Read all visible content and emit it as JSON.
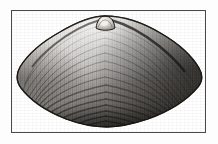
{
  "figure": {
    "kind": "scientific-illustration",
    "orientation": "exterior-left-valve",
    "technique": "halftone-engraving",
    "caption": "",
    "title": "",
    "has_text": false
  },
  "canvas": {
    "width": 218,
    "height": 144,
    "background_color": "#fdfdfd"
  },
  "frame": {
    "x": 11,
    "y": 10,
    "width": 195,
    "height": 123,
    "border_color": "#4a4a4a",
    "border_width": 1,
    "fill_color": "#ffffff"
  },
  "shell": {
    "label": "clam-shell",
    "outline_color": "#1c1c1c",
    "body_light": "#d8d6d2",
    "body_mid": "#9b9894",
    "body_dark": "#3a3835",
    "ventral_shadow": "#2a2826",
    "umbo": {
      "label": "umbo-beak",
      "cx": 93,
      "cy": 13,
      "rx": 9,
      "ry": 8,
      "highlight_color": "#e9e7e3"
    },
    "extent": {
      "left_x": 4,
      "right_x": 190,
      "top_y": 5,
      "bottom_y": 116
    },
    "growth_ring_count": 17,
    "radial_striation_count": 46,
    "shading": {
      "brightest_region": "upper-left-dorsal",
      "darkest_region": "right-posterior-and-ventral-margin"
    }
  }
}
